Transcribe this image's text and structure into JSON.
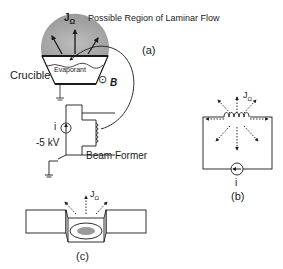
{
  "panel_a": {
    "region_label": "Possible Region of Laminar Flow",
    "flux_label": "J",
    "flux_sub": "Ω",
    "tag": "(a)",
    "crucible_label": "Crucible",
    "evaporant_label": "Evaporant",
    "field_label": "B",
    "field_symbol": "⊙",
    "current_label": "i",
    "voltage_label": "-5 kV",
    "beam_former_label": "Beam Former"
  },
  "panel_b": {
    "flux_label": "J",
    "flux_sub": "Ω",
    "current_label": "i",
    "tag": "(b)"
  },
  "panel_c": {
    "flux_label": "J",
    "flux_sub": "Ω",
    "tag": "(c)"
  },
  "colors": {
    "line": "#1a1a1a",
    "plume": "#a8a8a8",
    "spot": "#9a9a9a"
  }
}
